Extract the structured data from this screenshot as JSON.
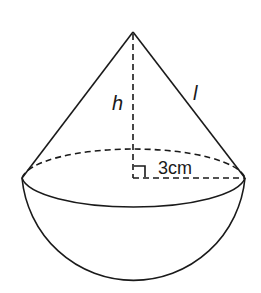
{
  "diagram": {
    "type": "solid-geometry",
    "labels": {
      "height": "h",
      "slant": "l",
      "radius": "3cm"
    },
    "colors": {
      "line": "#1a1a1a",
      "background": "#ffffff"
    },
    "geometry": {
      "apex": [
        133,
        32
      ],
      "base_center": [
        133,
        178
      ],
      "base_rx": 112,
      "base_ry": 32,
      "hemisphere_bottom_y": 291
    }
  }
}
